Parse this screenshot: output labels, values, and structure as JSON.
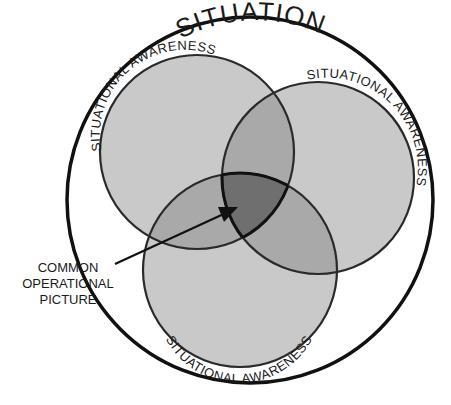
{
  "diagram": {
    "outer_label": "SITUATION",
    "circle_labels": [
      "SITUATIONAL AWARENESS",
      "SITUATIONAL AWARENESS",
      "SITUATIONAL AWARENESS"
    ],
    "callout": {
      "lines": [
        "COMMON",
        "OPERATIONAL",
        "PICTURE"
      ]
    },
    "colors": {
      "background": "#ffffff",
      "single_region": "#c9c9c9",
      "double_overlap": "#a9a9a9",
      "triple_overlap": "#6f6f6f",
      "outline": "#2a2a2a",
      "outer_outline": "#111111"
    }
  }
}
